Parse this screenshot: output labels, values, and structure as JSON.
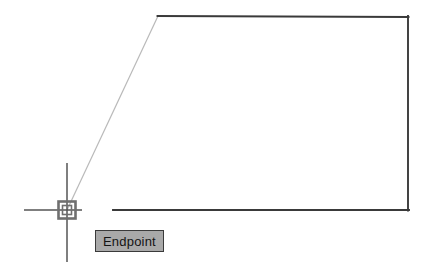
{
  "app": {
    "name": "CAD Drawing Canvas",
    "background_color": "#ffffff"
  },
  "tooltip": {
    "label": "Endpoint",
    "background_color": "#a9a9a9",
    "border_color": "#3a3a3a",
    "text_color": "#141414",
    "x": 95,
    "y": 230,
    "width": 87,
    "height": 22
  },
  "cursor": {
    "crosshair": {
      "center_x": 67,
      "center_y": 210,
      "horizontal_start_x": 24,
      "horizontal_end_x": 82,
      "vertical_start_y": 163,
      "vertical_end_y": 262,
      "color": "#555555",
      "width": 1.4
    },
    "snap_marker": {
      "type": "endpoint-square",
      "outer_x": 58,
      "outer_y": 201,
      "outer_size": 18,
      "inner_x": 62,
      "inner_y": 205,
      "inner_size": 10,
      "color": "#6b6b6b",
      "stroke_width": 2.4
    }
  },
  "geometry": {
    "stroke_color": "#3a3a3a",
    "stroke_width": 1.8,
    "rubber_band_color": "#b9b9b9",
    "rubber_band_width": 1.2,
    "shape_name": "quadrilateral-outline",
    "vertices": {
      "top_left": [
        158,
        16
      ],
      "top_right": [
        408,
        17
      ],
      "bottom_right": [
        408,
        210
      ],
      "bottom_left": [
        113,
        210
      ]
    },
    "segments": [
      {
        "name": "top-edge",
        "from": [
          158,
          16
        ],
        "to": [
          408,
          17
        ]
      },
      {
        "name": "right-edge",
        "from": [
          408,
          17
        ],
        "to": [
          408,
          210
        ]
      },
      {
        "name": "bottom-edge",
        "from": [
          408,
          210
        ],
        "to": [
          113,
          210
        ]
      }
    ],
    "rubber_band": {
      "name": "rubber-band-line",
      "from": [
        67,
        210
      ],
      "to": [
        158,
        16
      ]
    }
  }
}
